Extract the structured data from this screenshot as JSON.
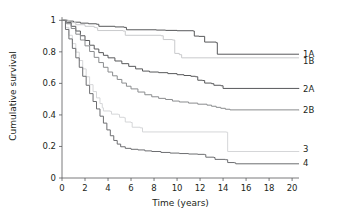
{
  "chart_data": {
    "type": "line",
    "title": "",
    "subtitle": "",
    "xlabel": "Time (years)",
    "ylabel": "Cumulative survival",
    "xlim": [
      0,
      20.6
    ],
    "ylim": [
      0,
      1.04
    ],
    "xticks": [
      0,
      2,
      4,
      6,
      8,
      10,
      12,
      14,
      16,
      18,
      20
    ],
    "xtick_labels": [
      "0",
      "2",
      "4",
      "6",
      "8",
      "10",
      "12",
      "14",
      "16",
      "18",
      "20"
    ],
    "yticks": [
      0,
      0.2,
      0.4,
      0.6,
      0.8,
      1
    ],
    "ytick_labels": [
      "0",
      "0.2",
      "0.4",
      "0.6",
      "0.8",
      "1"
    ],
    "grid": false,
    "legend_position": "right-inline",
    "curve_style": "kaplan-meier-step",
    "series": [
      {
        "name": "1A",
        "label": "1A",
        "color": "#58595b",
        "width": 1.0,
        "end_value": 0.785,
        "points": [
          [
            0,
            1.0
          ],
          [
            0.5,
            0.995
          ],
          [
            1.0,
            0.988
          ],
          [
            1.6,
            0.982
          ],
          [
            2.3,
            0.978
          ],
          [
            3.0,
            0.975
          ],
          [
            3.2,
            0.962
          ],
          [
            4.6,
            0.958
          ],
          [
            5.4,
            0.955
          ],
          [
            5.6,
            0.94
          ],
          [
            8.2,
            0.938
          ],
          [
            9.0,
            0.936
          ],
          [
            10.0,
            0.934
          ],
          [
            11.4,
            0.932
          ],
          [
            11.5,
            0.9
          ],
          [
            11.9,
            0.898
          ],
          [
            12.4,
            0.862
          ],
          [
            13.4,
            0.858
          ],
          [
            13.5,
            0.785
          ],
          [
            20.6,
            0.785
          ]
        ]
      },
      {
        "name": "1B",
        "label": "1B",
        "color": "#c9cacc",
        "width": 1.0,
        "end_value": 0.76,
        "points": [
          [
            0,
            1.0
          ],
          [
            0.6,
            0.985
          ],
          [
            1.2,
            0.972
          ],
          [
            2.0,
            0.962
          ],
          [
            2.8,
            0.955
          ],
          [
            3.0,
            0.952
          ],
          [
            3.1,
            0.935
          ],
          [
            5.3,
            0.932
          ],
          [
            5.5,
            0.905
          ],
          [
            8.6,
            0.902
          ],
          [
            8.8,
            0.878
          ],
          [
            9.6,
            0.875
          ],
          [
            9.8,
            0.79
          ],
          [
            10.2,
            0.782
          ],
          [
            10.4,
            0.762
          ],
          [
            20.6,
            0.762
          ]
        ]
      },
      {
        "name": "2A",
        "label": "2A",
        "color": "#58595b",
        "width": 1.0,
        "end_value": 0.565,
        "points": [
          [
            0,
            1.0
          ],
          [
            0.4,
            0.985
          ],
          [
            0.8,
            0.962
          ],
          [
            1.2,
            0.932
          ],
          [
            1.6,
            0.902
          ],
          [
            2.0,
            0.872
          ],
          [
            2.4,
            0.842
          ],
          [
            2.8,
            0.818
          ],
          [
            3.2,
            0.795
          ],
          [
            3.6,
            0.778
          ],
          [
            4.0,
            0.762
          ],
          [
            4.6,
            0.742
          ],
          [
            5.2,
            0.725
          ],
          [
            5.8,
            0.708
          ],
          [
            6.4,
            0.692
          ],
          [
            7.0,
            0.678
          ],
          [
            7.6,
            0.672
          ],
          [
            8.4,
            0.668
          ],
          [
            9.2,
            0.662
          ],
          [
            10.0,
            0.655
          ],
          [
            10.6,
            0.65
          ],
          [
            11.2,
            0.645
          ],
          [
            11.6,
            0.642
          ],
          [
            11.8,
            0.62
          ],
          [
            12.2,
            0.618
          ],
          [
            12.4,
            0.602
          ],
          [
            13.0,
            0.598
          ],
          [
            13.2,
            0.588
          ],
          [
            13.8,
            0.585
          ],
          [
            14.0,
            0.568
          ],
          [
            20.6,
            0.565
          ]
        ]
      },
      {
        "name": "2B",
        "label": "2B",
        "color": "#8a8c8e",
        "width": 1.0,
        "end_value": 0.43,
        "points": [
          [
            0,
            1.0
          ],
          [
            0.4,
            0.978
          ],
          [
            0.8,
            0.948
          ],
          [
            1.2,
            0.912
          ],
          [
            1.6,
            0.875
          ],
          [
            2.0,
            0.838
          ],
          [
            2.4,
            0.802
          ],
          [
            2.8,
            0.765
          ],
          [
            3.2,
            0.732
          ],
          [
            3.6,
            0.702
          ],
          [
            4.0,
            0.672
          ],
          [
            4.4,
            0.648
          ],
          [
            4.8,
            0.625
          ],
          [
            5.2,
            0.602
          ],
          [
            5.6,
            0.582
          ],
          [
            6.0,
            0.565
          ],
          [
            6.6,
            0.545
          ],
          [
            7.2,
            0.528
          ],
          [
            7.8,
            0.515
          ],
          [
            8.4,
            0.505
          ],
          [
            9.0,
            0.498
          ],
          [
            9.6,
            0.488
          ],
          [
            10.2,
            0.482
          ],
          [
            11.0,
            0.475
          ],
          [
            11.8,
            0.468
          ],
          [
            12.6,
            0.462
          ],
          [
            13.0,
            0.455
          ],
          [
            13.4,
            0.448
          ],
          [
            13.8,
            0.442
          ],
          [
            14.2,
            0.436
          ],
          [
            14.6,
            0.432
          ],
          [
            20.6,
            0.43
          ]
        ]
      },
      {
        "name": "3",
        "label": "3",
        "color": "#d5d6d8",
        "width": 1.0,
        "end_value": 0.165,
        "points": [
          [
            0,
            1.0
          ],
          [
            0.3,
            0.955
          ],
          [
            0.6,
            0.905
          ],
          [
            0.9,
            0.852
          ],
          [
            1.2,
            0.798
          ],
          [
            1.5,
            0.745
          ],
          [
            1.8,
            0.692
          ],
          [
            2.1,
            0.642
          ],
          [
            2.4,
            0.592
          ],
          [
            2.7,
            0.548
          ],
          [
            3.0,
            0.508
          ],
          [
            3.3,
            0.472
          ],
          [
            3.5,
            0.445
          ],
          [
            3.6,
            0.425
          ],
          [
            4.2,
            0.422
          ],
          [
            4.3,
            0.405
          ],
          [
            4.9,
            0.402
          ],
          [
            5.0,
            0.385
          ],
          [
            5.4,
            0.382
          ],
          [
            5.5,
            0.355
          ],
          [
            6.0,
            0.352
          ],
          [
            6.1,
            0.322
          ],
          [
            6.8,
            0.318
          ],
          [
            7.0,
            0.292
          ],
          [
            14.3,
            0.29
          ],
          [
            14.4,
            0.168
          ],
          [
            20.6,
            0.165
          ]
        ]
      },
      {
        "name": "4",
        "label": "4",
        "color": "#6d6e71",
        "width": 1.0,
        "end_value": 0.09,
        "points": [
          [
            0,
            1.0
          ],
          [
            0.3,
            0.942
          ],
          [
            0.6,
            0.882
          ],
          [
            0.9,
            0.822
          ],
          [
            1.2,
            0.762
          ],
          [
            1.5,
            0.702
          ],
          [
            1.8,
            0.645
          ],
          [
            2.1,
            0.588
          ],
          [
            2.4,
            0.535
          ],
          [
            2.7,
            0.485
          ],
          [
            3.0,
            0.438
          ],
          [
            3.3,
            0.392
          ],
          [
            3.6,
            0.348
          ],
          [
            3.9,
            0.305
          ],
          [
            4.2,
            0.268
          ],
          [
            4.5,
            0.238
          ],
          [
            4.8,
            0.215
          ],
          [
            5.1,
            0.198
          ],
          [
            5.5,
            0.188
          ],
          [
            6.0,
            0.182
          ],
          [
            6.6,
            0.178
          ],
          [
            7.2,
            0.172
          ],
          [
            7.8,
            0.168
          ],
          [
            8.6,
            0.162
          ],
          [
            9.4,
            0.158
          ],
          [
            10.2,
            0.155
          ],
          [
            11.0,
            0.152
          ],
          [
            11.8,
            0.15
          ],
          [
            12.4,
            0.148
          ],
          [
            12.5,
            0.132
          ],
          [
            13.2,
            0.13
          ],
          [
            13.3,
            0.118
          ],
          [
            14.2,
            0.116
          ],
          [
            14.4,
            0.098
          ],
          [
            15.0,
            0.096
          ],
          [
            15.1,
            0.09
          ],
          [
            20.6,
            0.09
          ]
        ]
      }
    ],
    "series_labels_right": [
      {
        "text": "1A",
        "value": 0.785
      },
      {
        "text": "1B",
        "value": 0.745
      },
      {
        "text": "2A",
        "value": 0.565
      },
      {
        "text": "2B",
        "value": 0.43
      },
      {
        "text": "3",
        "value": 0.185
      },
      {
        "text": "4",
        "value": 0.095
      }
    ]
  }
}
